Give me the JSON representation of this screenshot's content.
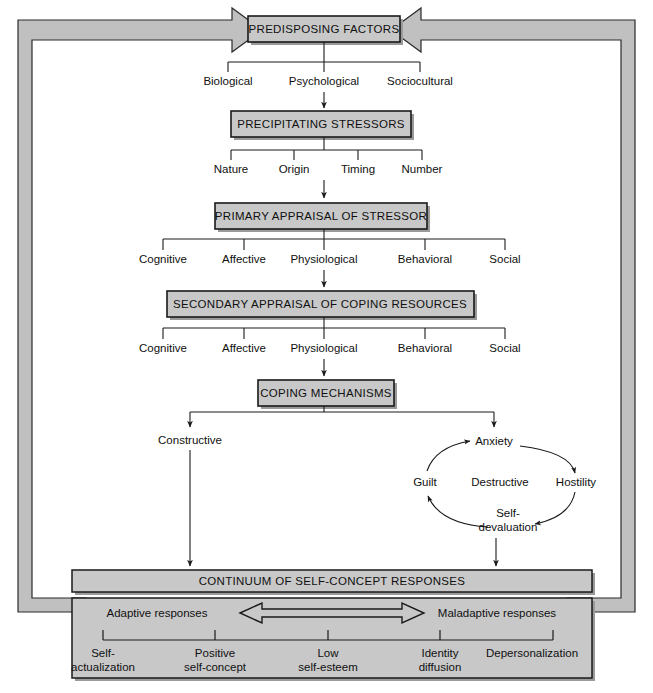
{
  "diagram": {
    "colors": {
      "box_fill": "#c8c8c8",
      "box_border": "#1a1a1a",
      "frame_fill": "#c0c0c0",
      "frame_border": "#2a2a2a",
      "line": "#1a1a1a",
      "page_background": "#ffffff",
      "shadow": "#9a9a9a"
    },
    "stages": [
      {
        "id": "predisposing-factors",
        "label": "PREDISPOSING FACTORS",
        "branches": [
          "Biological",
          "Psychological",
          "Sociocultural"
        ]
      },
      {
        "id": "precipitating-stressors",
        "label": "PRECIPITATING STRESSORS",
        "branches": [
          "Nature",
          "Origin",
          "Timing",
          "Number"
        ]
      },
      {
        "id": "primary-appraisal",
        "label": "PRIMARY APPRAISAL OF STRESSOR",
        "branches": [
          "Cognitive",
          "Affective",
          "Physiological",
          "Behavioral",
          "Social"
        ]
      },
      {
        "id": "secondary-appraisal",
        "label": "SECONDARY APPRAISAL OF COPING RESOURCES",
        "branches": [
          "Cognitive",
          "Affective",
          "Physiological",
          "Behavioral",
          "Social"
        ]
      },
      {
        "id": "coping-mechanisms",
        "label": "COPING MECHANISMS",
        "branches": []
      }
    ],
    "coping_outcomes": {
      "constructive": "Constructive",
      "destructive": "Destructive",
      "cycle": [
        "Anxiety",
        "Hostility",
        "Self-\ndevaluation",
        "Guilt"
      ],
      "cycle_nodes": [
        {
          "label": "Anxiety",
          "position": "top"
        },
        {
          "label": "Hostility",
          "position": "right"
        },
        {
          "label": "Self-",
          "label2": "devaluation",
          "position": "bottom"
        },
        {
          "label": "Guilt",
          "position": "left"
        }
      ]
    },
    "continuum": {
      "bar_label": "CONTINUUM OF SELF-CONCEPT RESPONSES",
      "left_end_label": "Adaptive responses",
      "right_end_label": "Maladaptive responses",
      "arrow_direction": "bidirectional",
      "scale_points": [
        {
          "line1": "Self-",
          "line2": "actualization"
        },
        {
          "line1": "Positive",
          "line2": "self-concept"
        },
        {
          "line1": "Low",
          "line2": "self-esteem"
        },
        {
          "line1": "Identity",
          "line2": "diffusion"
        },
        {
          "line1": "Depersonalization",
          "line2": ""
        }
      ]
    },
    "feedback_loop": {
      "description": "Feedback arrows from continuum back to predisposing factors",
      "left_arrow": "arrow-right-icon",
      "right_arrow": "arrow-left-icon"
    }
  }
}
